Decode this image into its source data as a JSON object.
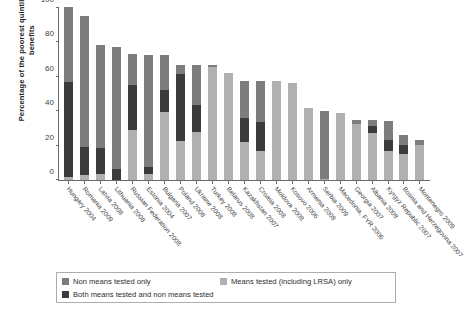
{
  "chart_data": {
    "type": "bar",
    "stacked": true,
    "title": "",
    "xlabel": "",
    "ylabel": "Percentage of the poorest quintile receiving benefits",
    "ylim": [
      0,
      100
    ],
    "yticks": [
      0,
      20,
      40,
      60,
      80,
      100
    ],
    "grid": false,
    "legend_position": "bottom",
    "categories": [
      "Hungary 2004",
      "Romania 2009",
      "Latvia 2008",
      "Lithuania 2008",
      "Russian Federation 2008",
      "Estonia 2004",
      "Bulgaria 2007",
      "Poland 2008",
      "Ukraine 2008",
      "Turkey 2008",
      "Belarus 2008",
      "Kazakhstan 2007",
      "Croatia 2008",
      "Moldova 2008",
      "Kosovo 2006",
      "Armenia 2008",
      "Serbia 2009",
      "Macedonia, FYR 2006",
      "Georgia 2007",
      "Albania 2008",
      "Kyrgyz Republic 2007",
      "Bosnia and Herzegovina 2007",
      "Montenegro 2009"
    ],
    "series": [
      {
        "name": "Means tested (including LRSA) only",
        "color": "#b0b0b0",
        "values": [
          1.5,
          3.0,
          3.5,
          0.0,
          29.0,
          3.5,
          39.5,
          22.5,
          28.0,
          65.5,
          62.0,
          22.0,
          16.5,
          57.0,
          56.0,
          41.5,
          0.8,
          38.5,
          32.5,
          27.0,
          16.5,
          15.0,
          20.5
        ]
      },
      {
        "name": "Both means tested and non means tested",
        "color": "#3b3b3b",
        "values": [
          55.0,
          16.0,
          15.0,
          6.5,
          26.0,
          4.0,
          12.5,
          38.5,
          15.5,
          0.0,
          0.0,
          14.0,
          17.0,
          0.0,
          0.0,
          0.0,
          0.0,
          0.0,
          0.0,
          4.5,
          6.5,
          5.5,
          0.0
        ]
      },
      {
        "name": "Non means tested only",
        "color": "#7d7d7d",
        "values": [
          43.5,
          76.0,
          59.5,
          70.5,
          18.0,
          65.0,
          20.5,
          5.5,
          23.0,
          1.0,
          0.0,
          21.5,
          24.0,
          0.0,
          0.0,
          0.0,
          39.0,
          0.0,
          2.0,
          3.0,
          11.0,
          5.5,
          2.5
        ]
      }
    ],
    "totals": [
      100,
      95,
      78,
      77,
      73,
      72.5,
      72.5,
      66.5,
      66.5,
      66.5,
      62,
      57.5,
      57.5,
      57,
      56,
      41.5,
      39.8,
      38.5,
      34.5,
      34.5,
      34,
      26,
      23
    ]
  },
  "legend": {
    "items": [
      {
        "label": "Non means tested only",
        "color": "#7d7d7d"
      },
      {
        "label": "Means tested (including LRSA) only",
        "color": "#b0b0b0"
      },
      {
        "label": "Both means tested and non means tested",
        "color": "#3b3b3b"
      }
    ]
  }
}
